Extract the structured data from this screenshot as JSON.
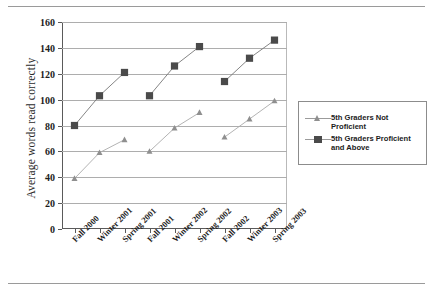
{
  "chart_data": {
    "type": "line",
    "title": "",
    "xlabel": "",
    "ylabel": "Average words read correctly",
    "categories": [
      "Fall 2000",
      "Winter 2001",
      "Spring 2001",
      "Fall 2001",
      "Winter 2002",
      "Spring 2002",
      "Fall 2002",
      "Winter 2003",
      "Spring 2003"
    ],
    "yticks": [
      0,
      20,
      40,
      60,
      80,
      100,
      120,
      140,
      160
    ],
    "ylim": [
      0,
      160
    ],
    "grid": true,
    "legend_position": "right",
    "series": [
      {
        "name": "5th Graders Not Proficient",
        "marker": "triangle",
        "color": "#8f8f8f",
        "values": [
          39,
          59,
          69,
          60,
          78,
          90,
          71,
          85,
          99
        ]
      },
      {
        "name": "5th Graders Proficient and Above",
        "marker": "square",
        "color": "#4a4a4a",
        "values": [
          80,
          103,
          121,
          103,
          126,
          141,
          114,
          132,
          146
        ]
      }
    ],
    "segments": [
      [
        0,
        1,
        2
      ],
      [
        3,
        4,
        5
      ],
      [
        6,
        7,
        8
      ]
    ]
  },
  "legend": {
    "entries": [
      {
        "label": "5th Graders Not Proficient",
        "marker": "triangle-icon"
      },
      {
        "label": "5th Graders Proficient and Above",
        "marker": "square-icon"
      }
    ]
  }
}
